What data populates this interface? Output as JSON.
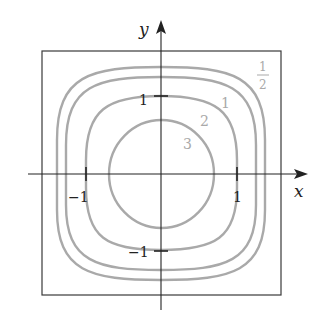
{
  "figure": {
    "type": "contour-plot",
    "axes": {
      "x_label": "x",
      "y_label": "y",
      "x_ticks": [
        {
          "value": -1,
          "label": "−1"
        },
        {
          "value": 1,
          "label": "1"
        }
      ],
      "y_ticks": [
        {
          "value": 1,
          "label": "1"
        },
        {
          "value": -1,
          "label": "−1"
        }
      ]
    },
    "contours": [
      {
        "level": "3",
        "label": "3",
        "half_extent_x": 0.69,
        "half_extent_y": 0.7,
        "shape": "circle"
      },
      {
        "level": "2",
        "label": "2",
        "half_extent_x": 1.0,
        "half_extent_y": 1.0,
        "shape": "rounded-square"
      },
      {
        "level": "1",
        "label": "1",
        "half_extent_x": 1.25,
        "half_extent_y": 1.26,
        "shape": "rounded-square"
      },
      {
        "level": "1/2",
        "label_num": "1",
        "label_den": "2",
        "half_extent_x": 1.37,
        "half_extent_y": 1.4,
        "shape": "rounded-square"
      }
    ],
    "colors": {
      "contour": "#a9a9a9",
      "axes": "#222222",
      "frame": "#3a3a3a"
    }
  }
}
